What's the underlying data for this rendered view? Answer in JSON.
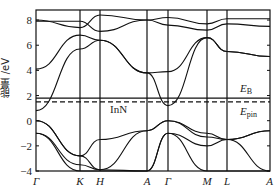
{
  "chart_data": {
    "type": "line",
    "title": "",
    "material_label": "InN",
    "xlabel": "",
    "ylabel": "能量 /eV",
    "ylim": [
      -4,
      8.8
    ],
    "yticks": [
      -4,
      -2,
      0,
      2,
      4,
      6,
      8
    ],
    "x_points": [
      "Γ",
      "K",
      "H",
      "A",
      "Γ",
      "M",
      "L",
      "A"
    ],
    "grid": false,
    "legend": "none",
    "reference_lines": [
      {
        "name": "E_B",
        "label": "E",
        "subscript": "B",
        "style": "solid",
        "y": 1.8
      },
      {
        "name": "E_pin",
        "label": "E",
        "subscript": "pin",
        "style": "dashed",
        "y": 1.5
      }
    ],
    "series_note": "Band energies (eV) sampled at the high-symmetry points, listed per band",
    "series": [
      {
        "name": "valence band 1",
        "values": [
          0.0,
          -2.8,
          -1.5,
          -0.8,
          0.0,
          -1.3,
          -1.5,
          -0.8
        ]
      },
      {
        "name": "valence band 2",
        "values": [
          0.0,
          -2.8,
          -3.9,
          -0.8,
          0.0,
          -1.0,
          -1.5,
          -0.8
        ]
      },
      {
        "name": "valence band 3",
        "values": [
          -1.0,
          -3.5,
          -3.9,
          -4.0,
          -1.0,
          -2.0,
          -1.5,
          -4.0
        ]
      },
      {
        "name": "valence band 4",
        "values": [
          -1.0,
          -4.0,
          -4.0,
          -4.0,
          -1.0,
          -4.0,
          -4.0,
          -4.0
        ]
      },
      {
        "name": "conduction band 1",
        "values": [
          0.8,
          5.7,
          6.4,
          3.8,
          1.2,
          6.6,
          5.5,
          5.1
        ]
      },
      {
        "name": "conduction band 2",
        "values": [
          4.1,
          6.8,
          6.4,
          3.8,
          3.9,
          6.6,
          5.5,
          5.1
        ]
      },
      {
        "name": "conduction band 3",
        "values": [
          7.9,
          7.9,
          7.1,
          8.0,
          7.6,
          7.2,
          7.7,
          7.5
        ]
      },
      {
        "name": "conduction band 4",
        "values": [
          8.0,
          7.4,
          8.4,
          8.0,
          8.2,
          7.7,
          8.1,
          8.1
        ]
      }
    ]
  }
}
